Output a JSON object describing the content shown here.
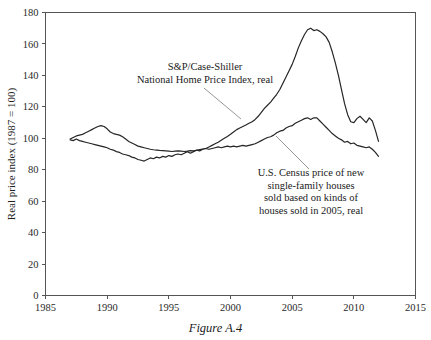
{
  "figure": {
    "caption": "Figure A.4",
    "background_color": "#ffffff",
    "line_color": "#262626",
    "axis_color": "#555555",
    "leader_color": "#8a8a8a"
  },
  "annotations": [
    {
      "id": "case-shiller-label",
      "lines": [
        "S&P/Case-Shiller",
        "National Home Price Index, real"
      ],
      "anchor_x": 205,
      "anchor_y": 70,
      "leader": {
        "x1": 204,
        "y1": 88,
        "x2": 241,
        "y2": 119
      }
    },
    {
      "id": "census-label",
      "lines": [
        "U.S. Census price of new",
        "single-family houses",
        "sold based on kinds of",
        "houses sold in 2005, real"
      ],
      "anchor_x": 311,
      "anchor_y": 176,
      "leader": {
        "x1": 276,
        "y1": 136,
        "x2": 309,
        "y2": 169
      }
    }
  ],
  "chart_data": {
    "type": "line",
    "title": "",
    "xlabel": "",
    "ylabel": "Real price index (1987 = 100)",
    "xlim": [
      1985,
      2015
    ],
    "ylim": [
      0,
      180
    ],
    "xticks": [
      1985,
      1990,
      1995,
      2000,
      2005,
      2010,
      2015
    ],
    "xtick_labels": [
      "1985",
      "1990",
      "1995",
      "2000",
      "2005",
      "2010",
      "2015"
    ],
    "yticks": [
      0,
      20,
      40,
      60,
      80,
      100,
      120,
      140,
      160,
      180
    ],
    "ytick_labels": [
      "0",
      "20",
      "40",
      "60",
      "80",
      "100",
      "120",
      "140",
      "160",
      "180"
    ],
    "grid": false,
    "legend_position": "inline-annotations",
    "series": [
      {
        "name": "S&P/Case-Shiller National Home Price Index, real",
        "x": [
          1987.0,
          1987.25,
          1987.5,
          1987.75,
          1988.0,
          1988.25,
          1988.5,
          1988.75,
          1989.0,
          1989.25,
          1989.5,
          1989.75,
          1990.0,
          1990.25,
          1990.5,
          1990.75,
          1991.0,
          1991.25,
          1991.5,
          1991.75,
          1992.0,
          1992.25,
          1992.5,
          1992.75,
          1993.0,
          1993.25,
          1993.5,
          1993.75,
          1994.0,
          1994.25,
          1994.5,
          1994.75,
          1995.0,
          1995.25,
          1995.5,
          1995.75,
          1996.0,
          1996.25,
          1996.5,
          1996.75,
          1997.0,
          1997.25,
          1997.5,
          1997.75,
          1998.0,
          1998.25,
          1998.5,
          1998.75,
          1999.0,
          1999.25,
          1999.5,
          1999.75,
          2000.0,
          2000.25,
          2000.5,
          2000.75,
          2001.0,
          2001.25,
          2001.5,
          2001.75,
          2002.0,
          2002.25,
          2002.5,
          2002.75,
          2003.0,
          2003.25,
          2003.5,
          2003.75,
          2004.0,
          2004.25,
          2004.5,
          2004.75,
          2005.0,
          2005.25,
          2005.5,
          2005.75,
          2006.0,
          2006.25,
          2006.5,
          2006.75,
          2007.0,
          2007.25,
          2007.5,
          2007.75,
          2008.0,
          2008.25,
          2008.5,
          2008.75,
          2009.0,
          2009.25,
          2009.5,
          2009.75,
          2010.0,
          2010.25,
          2010.5,
          2010.75,
          2011.0,
          2011.25,
          2011.5,
          2011.75,
          2012.0
        ],
        "y": [
          99.5,
          100.5,
          101.5,
          102.0,
          102.5,
          103.5,
          104.5,
          105.5,
          106.5,
          107.5,
          108.0,
          107.5,
          106.0,
          104.0,
          103.0,
          102.5,
          102.0,
          101.0,
          99.5,
          98.0,
          97.0,
          96.0,
          95.0,
          94.5,
          94.0,
          93.5,
          93.0,
          92.7,
          92.5,
          92.3,
          92.2,
          92.0,
          91.8,
          91.6,
          91.8,
          92.0,
          91.8,
          91.6,
          91.8,
          92.2,
          92.0,
          92.3,
          92.8,
          93.2,
          93.5,
          94.5,
          95.5,
          96.5,
          97.5,
          98.8,
          100.0,
          101.2,
          102.5,
          104.0,
          105.5,
          106.5,
          107.5,
          108.5,
          109.5,
          110.5,
          112.0,
          114.0,
          116.5,
          119.0,
          121.0,
          123.0,
          125.5,
          128.0,
          131.0,
          135.0,
          139.0,
          143.0,
          147.0,
          152.0,
          157.5,
          162.0,
          166.0,
          169.0,
          170.0,
          168.5,
          169.0,
          168.0,
          166.5,
          164.5,
          161.0,
          155.0,
          148.0,
          140.0,
          131.0,
          122.0,
          115.0,
          110.5,
          110.0,
          112.5,
          114.0,
          112.0,
          110.0,
          113.0,
          111.0,
          105.0,
          98.0
        ]
      },
      {
        "name": "U.S. Census price of new single-family houses sold based on kinds of houses sold in 2005, real",
        "x": [
          1987.0,
          1987.25,
          1987.5,
          1987.75,
          1988.0,
          1988.25,
          1988.5,
          1988.75,
          1989.0,
          1989.25,
          1989.5,
          1989.75,
          1990.0,
          1990.25,
          1990.5,
          1990.75,
          1991.0,
          1991.25,
          1991.5,
          1991.75,
          1992.0,
          1992.25,
          1992.5,
          1992.75,
          1993.0,
          1993.25,
          1993.5,
          1993.75,
          1994.0,
          1994.25,
          1994.5,
          1994.75,
          1995.0,
          1995.25,
          1995.5,
          1995.75,
          1996.0,
          1996.25,
          1996.5,
          1996.75,
          1997.0,
          1997.25,
          1997.5,
          1997.75,
          1998.0,
          1998.25,
          1998.5,
          1998.75,
          1999.0,
          1999.25,
          1999.5,
          1999.75,
          2000.0,
          2000.25,
          2000.5,
          2000.75,
          2001.0,
          2001.25,
          2001.5,
          2001.75,
          2002.0,
          2002.25,
          2002.5,
          2002.75,
          2003.0,
          2003.25,
          2003.5,
          2003.75,
          2004.0,
          2004.25,
          2004.5,
          2004.75,
          2005.0,
          2005.25,
          2005.5,
          2005.75,
          2006.0,
          2006.25,
          2006.5,
          2006.75,
          2007.0,
          2007.25,
          2007.5,
          2007.75,
          2008.0,
          2008.25,
          2008.5,
          2008.75,
          2009.0,
          2009.25,
          2009.5,
          2009.75,
          2010.0,
          2010.25,
          2010.5,
          2010.75,
          2011.0,
          2011.25,
          2011.5,
          2011.75,
          2012.0
        ],
        "y": [
          99.0,
          98.5,
          99.5,
          98.5,
          98.0,
          97.5,
          97.0,
          96.5,
          96.0,
          95.5,
          95.0,
          94.5,
          94.0,
          93.0,
          92.5,
          91.5,
          91.0,
          90.0,
          89.5,
          89.0,
          88.0,
          87.5,
          86.5,
          86.0,
          85.5,
          86.5,
          87.5,
          87.0,
          88.0,
          87.5,
          88.5,
          88.0,
          89.0,
          88.5,
          89.5,
          90.0,
          89.5,
          90.5,
          91.5,
          90.5,
          91.5,
          92.5,
          92.0,
          93.0,
          93.5,
          93.0,
          93.5,
          94.0,
          94.5,
          94.0,
          94.5,
          95.0,
          94.5,
          95.0,
          94.5,
          95.0,
          95.5,
          95.0,
          95.5,
          96.0,
          96.5,
          97.5,
          98.5,
          99.5,
          100.5,
          101.0,
          102.0,
          103.5,
          104.5,
          105.0,
          106.5,
          107.5,
          108.0,
          109.5,
          110.5,
          111.5,
          112.5,
          113.0,
          112.0,
          113.0,
          113.0,
          111.0,
          109.0,
          107.0,
          105.0,
          103.0,
          101.5,
          100.0,
          99.0,
          97.5,
          98.0,
          96.5,
          97.0,
          95.5,
          95.0,
          94.5,
          94.0,
          94.5,
          93.0,
          91.0,
          88.5
        ]
      }
    ]
  }
}
